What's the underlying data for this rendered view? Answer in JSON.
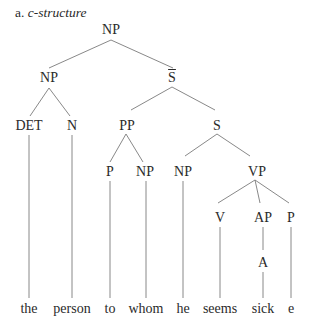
{
  "title": {
    "prefix": "a.",
    "text": "c-structure"
  },
  "nodes": [
    {
      "id": "np_root",
      "label": "NP",
      "x": 111,
      "y": 23
    },
    {
      "id": "np_left",
      "label": "NP",
      "x": 49,
      "y": 71
    },
    {
      "id": "sbar",
      "label": "S",
      "overline": true,
      "x": 172,
      "y": 71
    },
    {
      "id": "det",
      "label": "DET",
      "x": 29,
      "y": 119
    },
    {
      "id": "n",
      "label": "N",
      "x": 72,
      "y": 119
    },
    {
      "id": "pp",
      "label": "PP",
      "x": 127,
      "y": 119
    },
    {
      "id": "s",
      "label": "S",
      "x": 217,
      "y": 119
    },
    {
      "id": "p1",
      "label": "P",
      "x": 110,
      "y": 165
    },
    {
      "id": "np_whom",
      "label": "NP",
      "x": 145,
      "y": 165
    },
    {
      "id": "np_he",
      "label": "NP",
      "x": 183,
      "y": 165
    },
    {
      "id": "vp",
      "label": "VP",
      "x": 257,
      "y": 165
    },
    {
      "id": "v",
      "label": "V",
      "x": 220,
      "y": 211
    },
    {
      "id": "ap",
      "label": "AP",
      "x": 263,
      "y": 211
    },
    {
      "id": "p2",
      "label": "P",
      "x": 291,
      "y": 211
    },
    {
      "id": "a",
      "label": "A",
      "x": 263,
      "y": 256
    }
  ],
  "words": [
    {
      "text": "the",
      "x": 29
    },
    {
      "text": "person",
      "x": 72
    },
    {
      "text": "to",
      "x": 110
    },
    {
      "text": "whom",
      "x": 146
    },
    {
      "text": "he",
      "x": 183
    },
    {
      "text": "seems",
      "x": 220
    },
    {
      "text": "sick",
      "x": 263
    },
    {
      "text": "e",
      "x": 291
    }
  ],
  "words_y": 302,
  "line_color": "#7a7a7a"
}
